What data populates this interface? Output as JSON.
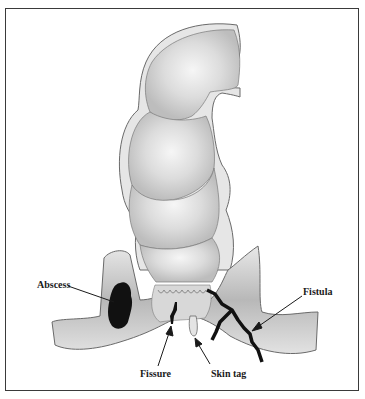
{
  "figure": {
    "colors": {
      "tissue_fill": "#c8c8c8",
      "tissue_highlight": "#f4f4f4",
      "outline": "#6a6a6a",
      "lesion": "#111111",
      "frame": "#3a3a3a"
    },
    "labels": {
      "abscess": "Abscess",
      "fistula": "Fistula",
      "fissure": "Fissure",
      "skin_tag": "Skin tag"
    }
  }
}
